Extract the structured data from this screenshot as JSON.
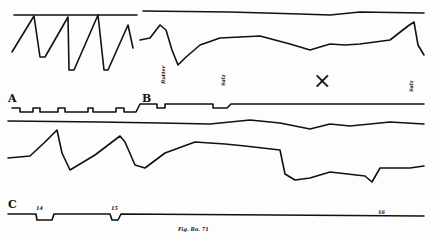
{
  "figure": {
    "panel_labels": [
      "A",
      "B",
      "C"
    ],
    "marker": "×",
    "annotations": {
      "b_left": "Butter",
      "b_mid": "Salz",
      "b_right": "Salz",
      "c_mark1": "14",
      "c_mark2": "15",
      "c_mark3": "16",
      "caption": "Fig. Bn. 71"
    }
  }
}
